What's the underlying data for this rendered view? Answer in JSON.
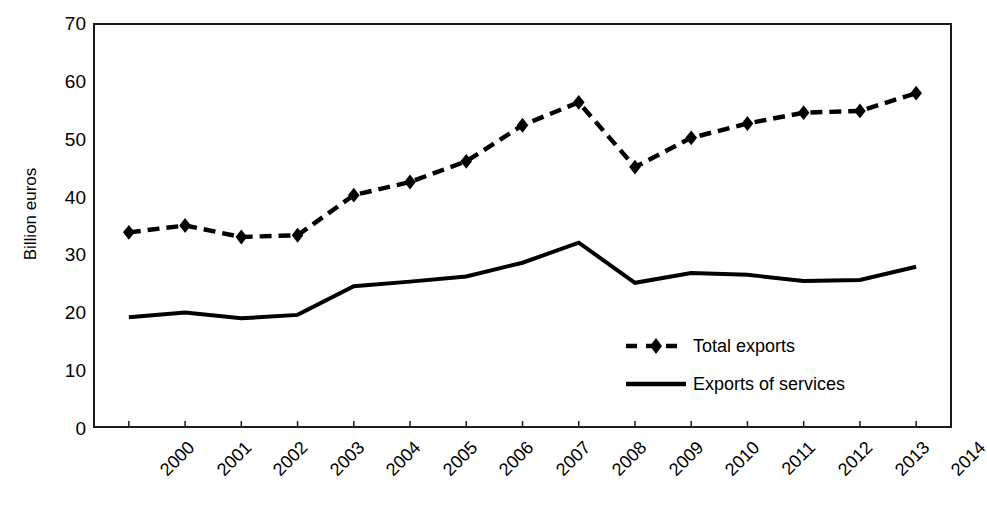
{
  "chart_data": {
    "type": "line",
    "title": "",
    "xlabel": "",
    "ylabel": "Billion euros",
    "ylim": [
      0,
      70
    ],
    "ytick_step": 10,
    "yticks": [
      70,
      60,
      50,
      40,
      30,
      20,
      10,
      0
    ],
    "grid": false,
    "legend_position": "inside-lower-right",
    "categories": [
      "2000",
      "2001",
      "2002",
      "2003",
      "2004",
      "2005",
      "2006",
      "2007",
      "2008",
      "2009",
      "2010",
      "2011",
      "2012",
      "2013",
      "2014"
    ],
    "series": [
      {
        "name": "Total exports",
        "style": "dashed",
        "marker": "diamond",
        "color": "#000000",
        "values": [
          33.8,
          35.0,
          33.0,
          33.3,
          40.3,
          42.6,
          46.2,
          52.5,
          56.5,
          45.2,
          50.3,
          52.8,
          54.7,
          55.0,
          58.1
        ]
      },
      {
        "name": "Exports of services",
        "style": "solid",
        "marker": "none",
        "color": "#000000",
        "values": [
          19.0,
          19.8,
          18.8,
          19.4,
          24.4,
          25.2,
          26.1,
          28.5,
          32.0,
          25.0,
          26.7,
          26.4,
          25.3,
          25.5,
          27.8
        ]
      }
    ]
  },
  "legend": {
    "items": [
      {
        "label": "Total exports",
        "key": "dashed-diamond-key"
      },
      {
        "label": "Exports of services",
        "key": "solid-line-key"
      }
    ]
  }
}
